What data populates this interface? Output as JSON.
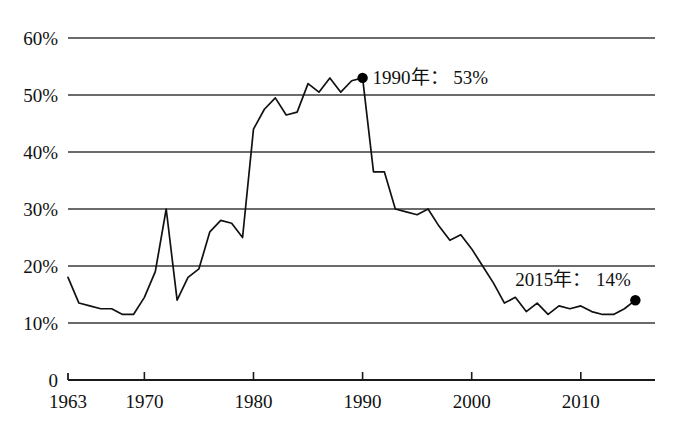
{
  "figure": {
    "clipped_header_text": "",
    "background_color": "#ffffff",
    "line_color": "#111111",
    "grid_color": "#3a3a3a",
    "marker_color": "#000000"
  },
  "axes": {
    "y_ticks": [
      "60%",
      "50%",
      "40%",
      "30%",
      "20%",
      "10%",
      "0"
    ],
    "x_ticks": [
      "1963",
      "1970",
      "1980",
      "1990",
      "2000",
      "2010"
    ]
  },
  "annotations": [
    {
      "text": "1990年： 53%",
      "year": 1990,
      "value": 53
    },
    {
      "text": "2015年： 14%",
      "year": 2015,
      "value": 14
    }
  ],
  "chart_data": {
    "type": "line",
    "title": "",
    "xlabel": "",
    "ylabel": "",
    "xlim": [
      1963,
      2015
    ],
    "ylim": [
      0,
      60
    ],
    "grid": true,
    "legend": false,
    "y_tick_values": [
      0,
      10,
      20,
      30,
      40,
      50,
      60
    ],
    "y_tick_labels": [
      "0",
      "10%",
      "20%",
      "30%",
      "40%",
      "50%",
      "60%"
    ],
    "x_tick_values": [
      1963,
      1970,
      1980,
      1990,
      2000,
      2010
    ],
    "x_tick_labels": [
      "1963",
      "1970",
      "1980",
      "1990",
      "2000",
      "2010"
    ],
    "x": [
      1963,
      1964,
      1965,
      1966,
      1967,
      1968,
      1969,
      1970,
      1971,
      1972,
      1973,
      1974,
      1975,
      1976,
      1977,
      1978,
      1979,
      1980,
      1981,
      1982,
      1983,
      1984,
      1985,
      1986,
      1987,
      1988,
      1989,
      1990,
      1991,
      1992,
      1993,
      1994,
      1995,
      1996,
      1997,
      1998,
      1999,
      2000,
      2001,
      2002,
      2003,
      2004,
      2005,
      2006,
      2007,
      2008,
      2009,
      2010,
      2011,
      2012,
      2013,
      2014,
      2015
    ],
    "values": [
      18,
      13.5,
      13,
      12.5,
      12.5,
      11.5,
      11.5,
      14.5,
      19,
      30,
      14,
      18,
      19.5,
      26,
      28,
      27.5,
      25,
      44,
      47.5,
      49.5,
      46.5,
      47,
      52,
      50.5,
      53,
      50.5,
      52.5,
      53,
      36.5,
      36.5,
      30,
      29.5,
      29,
      30,
      27,
      24.5,
      25.5,
      23,
      20,
      17,
      13.5,
      14.5,
      12,
      13.5,
      11.5,
      13,
      12.5,
      13,
      12,
      11.5,
      11.5,
      12.5,
      14
    ],
    "markers": [
      {
        "x": 1990,
        "y": 53
      },
      {
        "x": 2015,
        "y": 14
      }
    ],
    "annotations": [
      {
        "x": 1990,
        "y": 53,
        "text": "1990年： 53%"
      },
      {
        "x": 2015,
        "y": 14,
        "text": "2015年： 14%"
      }
    ]
  }
}
